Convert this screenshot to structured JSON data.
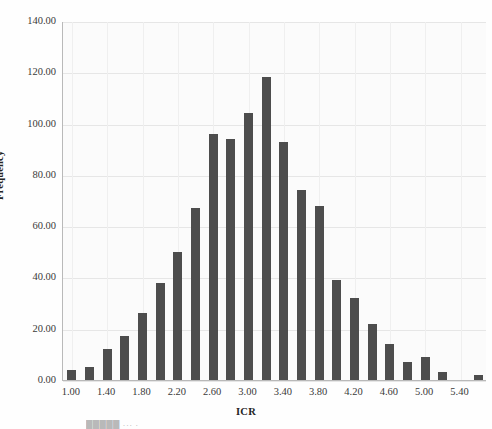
{
  "chart_data": {
    "type": "bar",
    "title": "",
    "xlabel": "ICR",
    "ylabel": "Frequency",
    "ylim": [
      0,
      140
    ],
    "yticks": [
      "0.00",
      "20.00",
      "40.00",
      "60.00",
      "80.00",
      "100.00",
      "120.00",
      "140.00"
    ],
    "ytick_values": [
      0,
      20,
      40,
      60,
      80,
      100,
      120,
      140
    ],
    "xlim": [
      0.9,
      5.7
    ],
    "xticks": [
      "1.00",
      "1.40",
      "1.80",
      "2.20",
      "2.60",
      "3.00",
      "3.40",
      "3.80",
      "4.20",
      "4.60",
      "5.00",
      "5.40"
    ],
    "xtick_values": [
      1.0,
      1.4,
      1.8,
      2.2,
      2.6,
      3.0,
      3.4,
      3.8,
      4.2,
      4.6,
      5.0,
      5.4
    ],
    "grid": true,
    "legend": "none",
    "bar_color": "#4d4d4d",
    "categories": [
      "1.00",
      "1.20",
      "1.40",
      "1.60",
      "1.80",
      "2.00",
      "2.20",
      "2.40",
      "2.60",
      "2.80",
      "3.00",
      "3.20",
      "3.40",
      "3.60",
      "3.80",
      "4.00",
      "4.20",
      "4.40",
      "4.60",
      "4.80",
      "5.00",
      "5.20",
      "5.40",
      "5.60"
    ],
    "values": [
      4,
      5,
      12,
      17,
      26,
      38,
      50,
      67,
      96,
      94,
      104,
      118,
      93,
      74,
      68,
      39,
      32,
      22,
      14,
      7,
      9,
      3,
      0,
      2
    ]
  },
  "caption": {
    "text": "█████ ··· ·"
  }
}
